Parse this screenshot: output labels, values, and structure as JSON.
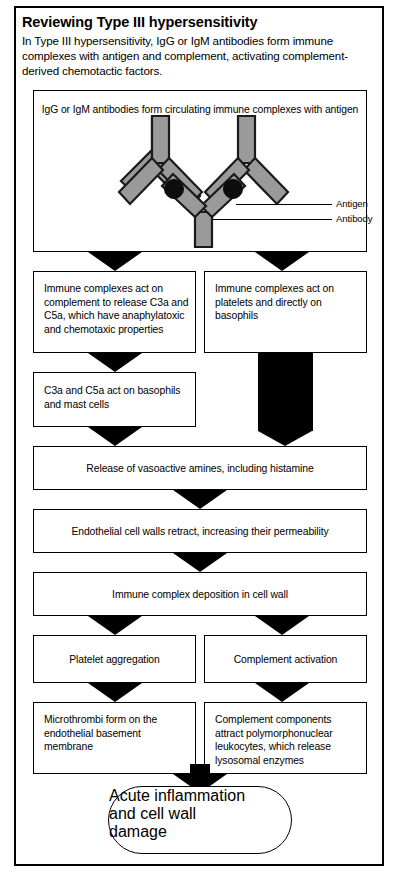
{
  "header": {
    "title": "Reviewing Type III hypersensitivity",
    "intro": "In Type III hypersensitivity, IgG or IgM antibodies form immune complexes with antigen and complement, activating complement-derived chemotactic factors."
  },
  "illustration": {
    "caption": "IgG or IgM antibodies form circulating immune complexes with antigen",
    "labels": {
      "antigen": "Antigen",
      "antibody": "Antibody"
    },
    "colors": {
      "antibody_fill": "#9a9a9a",
      "antibody_stroke": "#1a1a1a",
      "antigen_fill": "#0d0d0d"
    }
  },
  "flow": {
    "step_left_1": "Immune complexes act on complement to release C3a and C5a, which have anaphylatoxic and chemotaxic properties",
    "step_right_1": "Immune complexes act on platelets and directly on basophils",
    "step_left_2": "C3a and C5a act on basophils and mast cells",
    "step_full_1": "Release of vasoactive amines, including histamine",
    "step_full_2": "Endothelial cell walls retract, increasing their permeability",
    "step_full_3": "Immune complex deposition in cell wall",
    "step_left_3": "Platelet aggregation",
    "step_right_2": "Complement activation",
    "step_left_4": "Microthrombi form on the endothelial basement membrane",
    "step_right_3": "Complement components attract polymorphonuclear leukocytes, which release lysosomal enzymes",
    "terminal": "Acute inflammation and cell wall damage"
  }
}
